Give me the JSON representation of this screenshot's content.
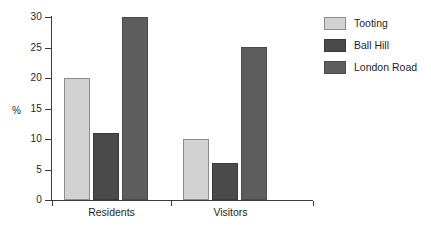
{
  "chart_data": {
    "type": "bar",
    "title": "",
    "subtitle": "",
    "xlabel": "",
    "ylabel": "%",
    "categories": [
      "Residents",
      "Visitors"
    ],
    "series": [
      {
        "name": "Tooting",
        "values": [
          20,
          10
        ],
        "color": "#d2d2d2"
      },
      {
        "name": "Ball Hill",
        "values": [
          11,
          6
        ],
        "color": "#4a4a4a"
      },
      {
        "name": "London Road",
        "values": [
          30,
          25
        ],
        "color": "#5d5d5d"
      }
    ],
    "ylim": [
      0,
      30
    ],
    "yticks": [
      0,
      5,
      10,
      15,
      20,
      25,
      30
    ],
    "ytick_labels": [
      "0",
      "5",
      "10",
      "15",
      "20",
      "25",
      "30"
    ],
    "grid": false,
    "legend_position": "right",
    "background": "#ffffff",
    "axis_color": "#3b3b3b",
    "text_color": "#1f1f1f"
  }
}
